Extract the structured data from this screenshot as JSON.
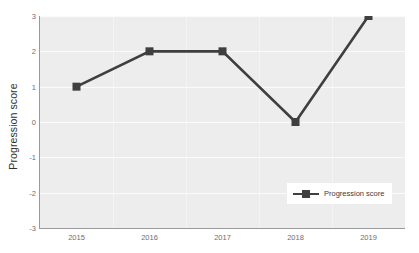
{
  "chart_data": {
    "type": "line",
    "title": "",
    "xlabel": "",
    "ylabel": "Progression score",
    "categories": [
      "2015",
      "2016",
      "2017",
      "2018",
      "2019"
    ],
    "series": [
      {
        "name": "Progression score",
        "values": [
          1,
          2,
          2,
          0,
          3
        ],
        "color": "#3f3f3f",
        "marker": "square"
      }
    ],
    "ylim": [
      -3,
      3
    ],
    "yticks": [
      3,
      2,
      1,
      0,
      -1,
      -2,
      -3
    ],
    "ytick_labels": [
      "3",
      "2",
      "1",
      "0",
      "-1",
      "-2",
      "-3"
    ],
    "grid": true,
    "legend_position": "bottom-right"
  },
  "axes": {
    "y_title": "Progression score"
  },
  "legend": {
    "entries": [
      {
        "label": "Progression score"
      }
    ]
  },
  "colors": {
    "plot_background": "#ededed",
    "gridline": "#fbfbfb",
    "series_line": "#3f3f3f",
    "axis_line": "#9a9a9a",
    "tick_text": "#6e6e6e",
    "title_text": "#2f2f2f",
    "legend_background": "#ffffff",
    "page_background": "#ffffff"
  }
}
